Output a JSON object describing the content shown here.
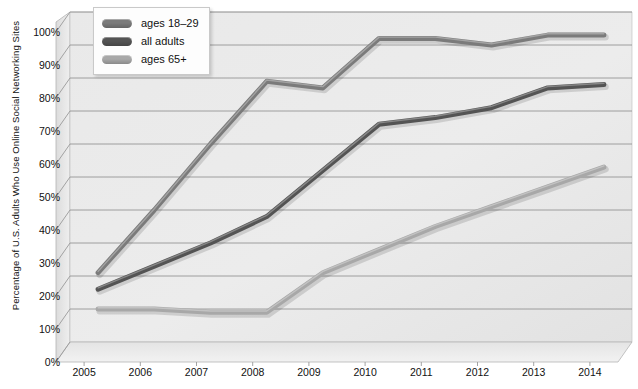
{
  "chart_data": {
    "type": "line",
    "title": "",
    "xlabel": "",
    "ylabel": "Percentage of U.S. Adults Who Use Online Social Networking Sites",
    "categories": [
      "2005",
      "2006",
      "2007",
      "2008",
      "2009",
      "2010",
      "2011",
      "2012",
      "2013",
      "2014"
    ],
    "x": [
      2005,
      2006,
      2007,
      2008,
      2009,
      2010,
      2011,
      2012,
      2013,
      2014
    ],
    "ylim": [
      0,
      100
    ],
    "yticks": [
      "0%",
      "10%",
      "20%",
      "30%",
      "40%",
      "50%",
      "60%",
      "70%",
      "80%",
      "90%",
      "100%"
    ],
    "ytick_values": [
      0,
      10,
      20,
      30,
      40,
      50,
      60,
      70,
      80,
      90,
      100
    ],
    "grid": true,
    "legend_position": "top-left",
    "series": [
      {
        "name": "ages 18–29",
        "color": "#7b7b7b",
        "values": [
          21,
          40,
          60,
          79,
          77,
          92,
          92,
          90,
          93,
          93
        ]
      },
      {
        "name": "all adults",
        "color": "#545454",
        "values": [
          16,
          23,
          30,
          38,
          52,
          66,
          68,
          71,
          77,
          78
        ]
      },
      {
        "name": "ages 65+",
        "color": "#a8a8a8",
        "values": [
          10,
          10,
          9,
          9,
          21,
          28,
          35,
          41,
          47,
          53
        ]
      }
    ]
  },
  "legend": {
    "items": [
      {
        "label": "ages 18–29",
        "color": "#7b7b7b"
      },
      {
        "label": "all adults",
        "color": "#545454"
      },
      {
        "label": "ages 65+",
        "color": "#a8a8a8"
      }
    ]
  },
  "colors": {
    "plot_background": "#e8e8e8",
    "wall_light": "#efefef",
    "wall_dark": "#d8d8d8",
    "gridline": "#8c8c8c",
    "axis_line": "#9a9a9a",
    "text": "#111111"
  }
}
